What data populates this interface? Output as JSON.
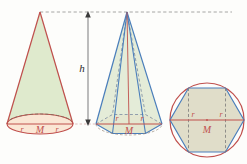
{
  "figure": {
    "background_color": "#fdfdfb",
    "colors": {
      "cone_outline": "#c0504d",
      "cone_body_fill": "#dfeacd",
      "cone_base_fill": "#fbe6d4",
      "pyramid_outline": "#4a7ebb",
      "pyramid_body_fill": "#dfe8d0",
      "pyramid_base_fill": "#fbe0d2",
      "hexagon_fill": "#ddd9c3",
      "circle_outline": "#c0504d",
      "hexagon_outline": "#4a7ebb",
      "dashed_gray": "#8f8f8f",
      "height_arrow": "#9a9a9a",
      "radius_line": "#c0504d",
      "label_red": "#c0504d",
      "label_black": "#2b2b2b"
    },
    "shapes": [
      {
        "name": "cone",
        "type": "cone",
        "apex": [
          40,
          12
        ],
        "base_center": [
          40,
          124
        ],
        "base_rx": 33,
        "base_ry": 10,
        "labels": [
          "r",
          "M",
          "r"
        ]
      },
      {
        "name": "hexagonal-pyramid",
        "type": "pyramid",
        "apex": [
          127,
          12
        ],
        "base_center": [
          129,
          124
        ],
        "base_rx": 33,
        "base_ry": 11,
        "sides": 6,
        "labels": [
          "r",
          "r",
          "M"
        ]
      },
      {
        "name": "inscribed-hexagon",
        "type": "circle-with-hexagon",
        "center": [
          207,
          120
        ],
        "radius": 37,
        "sides": 6,
        "labels": [
          "r",
          "r",
          "M"
        ]
      }
    ],
    "labels": {
      "height": "h",
      "radius": "r",
      "center": "M"
    }
  }
}
